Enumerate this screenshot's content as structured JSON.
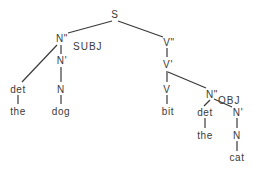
{
  "diagram": {
    "type": "syntax-tree",
    "nodes": {
      "s": {
        "label": "S",
        "x": 115,
        "y": 18
      },
      "n2_subj": {
        "label": "N\"",
        "x": 61,
        "y": 42
      },
      "subj_tag": {
        "label": "SUBJ",
        "x": 73,
        "y": 50
      },
      "n1_subj": {
        "label": "N'",
        "x": 61,
        "y": 64
      },
      "det_subj": {
        "label": "det",
        "x": 17,
        "y": 92
      },
      "n0_subj": {
        "label": "N",
        "x": 61,
        "y": 92
      },
      "the_subj": {
        "label": "the",
        "x": 18,
        "y": 115
      },
      "dog": {
        "label": "dog",
        "x": 61,
        "y": 115
      },
      "v2": {
        "label": "V\"",
        "x": 168,
        "y": 45
      },
      "v1": {
        "label": "V'",
        "x": 168,
        "y": 67
      },
      "v0": {
        "label": "V",
        "x": 168,
        "y": 92
      },
      "bit": {
        "label": "bit",
        "x": 168,
        "y": 115
      },
      "n2_obj": {
        "label": "N\"",
        "x": 212,
        "y": 98
      },
      "obj_tag": {
        "label": "OBJ",
        "x": 221,
        "y": 104
      },
      "det_obj": {
        "label": "det",
        "x": 205,
        "y": 115
      },
      "the_obj": {
        "label": "the",
        "x": 205,
        "y": 138
      },
      "n1_obj": {
        "label": "N'",
        "x": 238,
        "y": 115
      },
      "n0_obj": {
        "label": "N",
        "x": 238,
        "y": 138
      },
      "cat": {
        "label": "cat",
        "x": 238,
        "y": 161
      }
    }
  }
}
